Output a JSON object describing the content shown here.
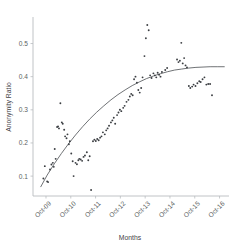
{
  "chart_data": {
    "type": "scatter",
    "title": "",
    "xlabel": "Months",
    "ylabel": "Anonymity Ratio",
    "grid": false,
    "legend": "none",
    "xlim": [
      0,
      8.3
    ],
    "ylim": [
      0.04,
      0.58
    ],
    "x_tick_labels": [
      "Oct-09",
      "Oct-10",
      "Oct-11",
      "Oct-12",
      "Oct-13",
      "Oct-14",
      "Oct-15",
      "Oct-16"
    ],
    "x_tick_values": [
      0.55,
      1.6,
      2.65,
      3.7,
      4.75,
      5.8,
      6.85,
      7.9
    ],
    "y_tick_labels": [
      "0.1",
      "0.2",
      "0.3",
      "0.4",
      "0.5"
    ],
    "y_tick_values": [
      0.1,
      0.2,
      0.3,
      0.4,
      0.5
    ],
    "series": [
      {
        "name": "Anonymity Ratio observations",
        "marker": "dot",
        "color": "#3b3e42",
        "points": [
          [
            0.44,
            0.093
          ],
          [
            0.5,
            0.13
          ],
          [
            0.6,
            0.084
          ],
          [
            0.64,
            0.082
          ],
          [
            0.72,
            0.12
          ],
          [
            0.78,
            0.135
          ],
          [
            0.84,
            0.14
          ],
          [
            0.88,
            0.128
          ],
          [
            0.92,
            0.182
          ],
          [
            0.96,
            0.152
          ],
          [
            1.02,
            0.248
          ],
          [
            1.06,
            0.25
          ],
          [
            1.1,
            0.244
          ],
          [
            1.16,
            0.32
          ],
          [
            1.22,
            0.262
          ],
          [
            1.26,
            0.258
          ],
          [
            1.32,
            0.24
          ],
          [
            1.36,
            0.22
          ],
          [
            1.42,
            0.214
          ],
          [
            1.46,
            0.226
          ],
          [
            1.52,
            0.196
          ],
          [
            1.56,
            0.205
          ],
          [
            1.62,
            0.168
          ],
          [
            1.68,
            0.145
          ],
          [
            1.72,
            0.1
          ],
          [
            1.8,
            0.14
          ],
          [
            1.86,
            0.136
          ],
          [
            1.92,
            0.148
          ],
          [
            1.96,
            0.152
          ],
          [
            2.02,
            0.15
          ],
          [
            2.08,
            0.146
          ],
          [
            2.14,
            0.158
          ],
          [
            2.2,
            0.162
          ],
          [
            2.28,
            0.172
          ],
          [
            2.34,
            0.148
          ],
          [
            2.4,
            0.16
          ],
          [
            2.46,
            0.058
          ],
          [
            2.54,
            0.205
          ],
          [
            2.6,
            0.21
          ],
          [
            2.66,
            0.206
          ],
          [
            2.72,
            0.212
          ],
          [
            2.78,
            0.208
          ],
          [
            2.84,
            0.216
          ],
          [
            2.9,
            0.22
          ],
          [
            2.96,
            0.232
          ],
          [
            3.04,
            0.226
          ],
          [
            3.1,
            0.238
          ],
          [
            3.16,
            0.244
          ],
          [
            3.22,
            0.252
          ],
          [
            3.3,
            0.262
          ],
          [
            3.36,
            0.268
          ],
          [
            3.42,
            0.276
          ],
          [
            3.48,
            0.258
          ],
          [
            3.56,
            0.284
          ],
          [
            3.62,
            0.292
          ],
          [
            3.68,
            0.3
          ],
          [
            3.74,
            0.296
          ],
          [
            3.82,
            0.306
          ],
          [
            3.88,
            0.312
          ],
          [
            3.96,
            0.324
          ],
          [
            4.04,
            0.33
          ],
          [
            4.1,
            0.34
          ],
          [
            4.16,
            0.348
          ],
          [
            4.22,
            0.344
          ],
          [
            4.28,
            0.392
          ],
          [
            4.34,
            0.4
          ],
          [
            4.4,
            0.382
          ],
          [
            4.46,
            0.36
          ],
          [
            4.52,
            0.352
          ],
          [
            4.58,
            0.366
          ],
          [
            4.64,
            0.398
          ],
          [
            4.72,
            0.462
          ],
          [
            4.78,
            0.516
          ],
          [
            4.84,
            0.556
          ],
          [
            4.9,
            0.54
          ],
          [
            4.96,
            0.404
          ],
          [
            5.02,
            0.396
          ],
          [
            5.1,
            0.41
          ],
          [
            5.16,
            0.404
          ],
          [
            5.22,
            0.398
          ],
          [
            5.28,
            0.412
          ],
          [
            5.34,
            0.406
          ],
          [
            5.4,
            0.4
          ],
          [
            5.46,
            0.414
          ],
          [
            5.6,
            0.42
          ],
          [
            5.68,
            0.426
          ],
          [
            6.1,
            0.452
          ],
          [
            6.16,
            0.444
          ],
          [
            6.22,
            0.448
          ],
          [
            6.28,
            0.502
          ],
          [
            6.34,
            0.44
          ],
          [
            6.4,
            0.456
          ],
          [
            6.46,
            0.434
          ],
          [
            6.52,
            0.428
          ],
          [
            6.6,
            0.372
          ],
          [
            6.66,
            0.366
          ],
          [
            6.74,
            0.37
          ],
          [
            6.8,
            0.376
          ],
          [
            6.88,
            0.372
          ],
          [
            6.96,
            0.38
          ],
          [
            7.04,
            0.386
          ],
          [
            7.1,
            0.384
          ],
          [
            7.18,
            0.392
          ],
          [
            7.26,
            0.398
          ],
          [
            7.34,
            0.376
          ],
          [
            7.42,
            0.378
          ],
          [
            7.5,
            0.378
          ],
          [
            7.58,
            0.344
          ]
        ]
      }
    ],
    "fit_curve": {
      "name": "logarithmic trend fit",
      "color": "#55585c",
      "points": [
        [
          0.33,
          0.068
        ],
        [
          0.6,
          0.103
        ],
        [
          0.9,
          0.137
        ],
        [
          1.2,
          0.168
        ],
        [
          1.5,
          0.197
        ],
        [
          1.8,
          0.224
        ],
        [
          2.1,
          0.249
        ],
        [
          2.4,
          0.272
        ],
        [
          2.7,
          0.293
        ],
        [
          3.0,
          0.312
        ],
        [
          3.3,
          0.33
        ],
        [
          3.6,
          0.346
        ],
        [
          3.9,
          0.36
        ],
        [
          4.2,
          0.373
        ],
        [
          4.5,
          0.384
        ],
        [
          4.8,
          0.394
        ],
        [
          5.1,
          0.402
        ],
        [
          5.4,
          0.409
        ],
        [
          5.7,
          0.415
        ],
        [
          6.0,
          0.42
        ],
        [
          6.3,
          0.423
        ],
        [
          6.6,
          0.426
        ],
        [
          6.9,
          0.428
        ],
        [
          7.2,
          0.429
        ],
        [
          7.5,
          0.43
        ],
        [
          7.8,
          0.43
        ],
        [
          8.1,
          0.43
        ]
      ]
    }
  }
}
